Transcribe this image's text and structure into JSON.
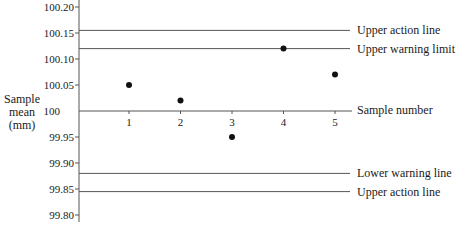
{
  "chart_data": {
    "type": "scatter",
    "title": "",
    "xlabel": "Sample number",
    "ylabel": [
      "Sample",
      "mean",
      "(mm)"
    ],
    "y_ticks": [
      "100.20",
      "100.15",
      "100.10",
      "100.05",
      "100",
      "99.95",
      "99.90",
      "99.85",
      "99.80"
    ],
    "y_tick_values": [
      100.2,
      100.15,
      100.1,
      100.05,
      100.0,
      99.95,
      99.9,
      99.85,
      99.8
    ],
    "x_ticks": [
      "1",
      "2",
      "3",
      "4",
      "5"
    ],
    "ylim": [
      99.8,
      100.2
    ],
    "grid": false,
    "series": [
      {
        "name": "Sample mean",
        "x": [
          1,
          2,
          3,
          4,
          5
        ],
        "values": [
          100.05,
          100.02,
          99.95,
          100.12,
          100.07
        ]
      }
    ],
    "reference_lines": [
      {
        "label": "Upper action line",
        "value": 100.155
      },
      {
        "label": "Upper warning limit",
        "value": 100.12
      },
      {
        "label": "Lower warning line",
        "value": 99.88
      },
      {
        "label": "Upper action line",
        "value": 99.845
      }
    ],
    "caption": "Figure 4.1"
  }
}
